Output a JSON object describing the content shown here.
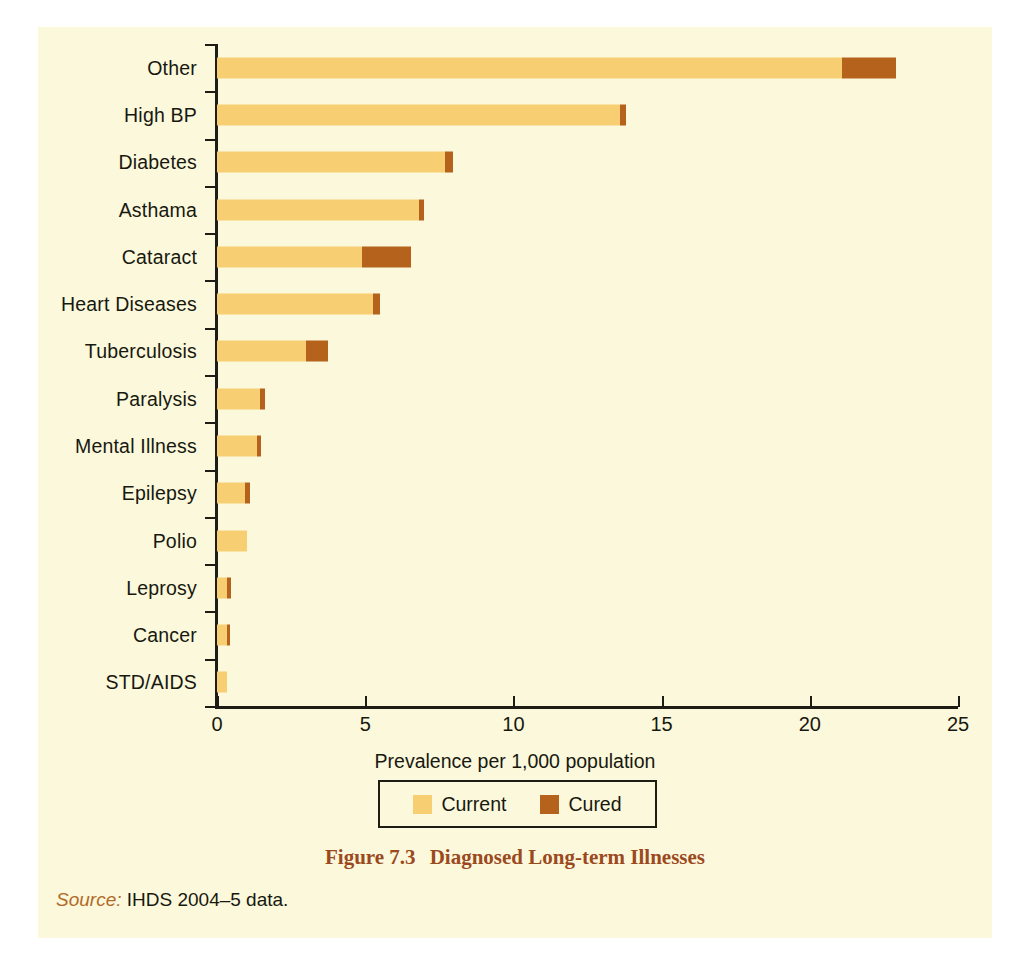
{
  "figure": {
    "caption_number": "Figure 7.3",
    "caption_title": "Diagnosed Long-term Illnesses",
    "source_label": "Source:",
    "source_text": "IHDS 2004–5 data."
  },
  "legend": {
    "entries": [
      {
        "label": "Current",
        "color": "#F8CE72"
      },
      {
        "label": "Cured",
        "color": "#B5621D"
      }
    ]
  },
  "chart_data": {
    "type": "bar",
    "orientation": "horizontal",
    "stacked": true,
    "title": "Diagnosed Long-term Illnesses",
    "xlabel": "Prevalence per 1,000 population",
    "ylabel": "",
    "xlim": [
      0,
      25
    ],
    "xticks": [
      0,
      5,
      10,
      15,
      20,
      25
    ],
    "xtick_labels": [
      "0",
      "5",
      "10",
      "15",
      "20",
      "25"
    ],
    "grid": false,
    "legend_position": "below-axis-center",
    "categories": [
      "Other",
      "High BP",
      "Diabetes",
      "Asthama",
      "Cataract",
      "Heart Diseases",
      "Tuberculosis",
      "Paralysis",
      "Mental Illness",
      "Epilepsy",
      "Polio",
      "Leprosy",
      "Cancer",
      "STD/AIDS"
    ],
    "series": [
      {
        "name": "Current",
        "color": "#F8CE72",
        "values": [
          21.1,
          13.6,
          7.7,
          6.8,
          4.9,
          5.25,
          3.0,
          1.45,
          1.35,
          0.95,
          1.0,
          0.35,
          0.35,
          0.33
        ]
      },
      {
        "name": "Cured",
        "color": "#B5621D",
        "values": [
          1.8,
          0.2,
          0.25,
          0.2,
          1.65,
          0.25,
          0.75,
          0.18,
          0.15,
          0.15,
          0.0,
          0.13,
          0.1,
          0.0
        ]
      }
    ],
    "totals": [
      22.9,
      13.8,
      7.95,
      7.0,
      6.55,
      5.5,
      3.75,
      1.63,
      1.5,
      1.1,
      1.0,
      0.48,
      0.45,
      0.33
    ]
  }
}
